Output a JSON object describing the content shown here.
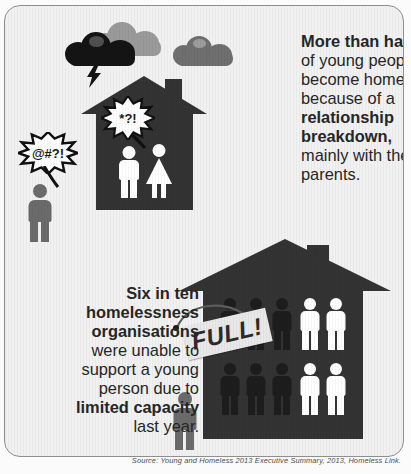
{
  "card": {
    "background_color": "#f1f1f1",
    "border_color": "#8e8e8e"
  },
  "colors": {
    "house_dark": "#333333",
    "figure_white": "#ffffff",
    "figure_dark": "#1d1d1d",
    "figure_gray": "#6b6b6b",
    "cloud_black": "#141414",
    "cloud_gray_light": "#9a9a9a",
    "cloud_gray_mid": "#6f6f6f",
    "text": "#262626",
    "sign": "#e8e8e8"
  },
  "stat_top": {
    "lines": [
      {
        "text": "More than half",
        "bold": true
      },
      {
        "text": "of young people",
        "bold": false
      },
      {
        "text": "become homeless",
        "bold": false
      },
      {
        "text": "because of a",
        "bold": false
      },
      {
        "text": "relationship",
        "bold": true
      },
      {
        "text": "breakdown,",
        "bold": true
      },
      {
        "text": "mainly with their",
        "bold": false
      },
      {
        "text": "parents.",
        "bold": false
      }
    ]
  },
  "stat_bottom": {
    "lines": [
      {
        "text": "Six in ten",
        "bold": true
      },
      {
        "text": "homelessness",
        "bold": true
      },
      {
        "text": "organisations",
        "bold": true
      },
      {
        "text": "were unable to",
        "bold": false
      },
      {
        "text": "support a young",
        "bold": false
      },
      {
        "text": "person due to",
        "bold": false
      },
      {
        "text": "limited capacity",
        "bold": true
      },
      {
        "text": "last year.",
        "bold": false
      }
    ]
  },
  "bursts": {
    "inside_house": "*?!",
    "outside_person": "@#?!"
  },
  "sign": {
    "label": "FULL!"
  },
  "scene_top": {
    "icon_names": [
      "storm-cloud-icon",
      "cloud-icon",
      "cloud-icon",
      "lightning-bolt-icon",
      "house-icon",
      "male-figure-icon",
      "female-figure-icon",
      "outside-person-icon"
    ],
    "people_inside": 2,
    "people_outside": 1,
    "clouds": 3
  },
  "scene_bottom": {
    "icon_names": [
      "house-icon",
      "full-sign-icon",
      "person-icon",
      "outside-person-icon"
    ],
    "rows": [
      {
        "dark": 3,
        "white": 2
      },
      {
        "dark": 3,
        "white": 2
      }
    ],
    "total_people": 10,
    "dark_people": 6,
    "people_outside": 1
  },
  "source": {
    "text": "Source: Young and Homeless 2013 Executive Summary, 2013, Homeless Link."
  }
}
